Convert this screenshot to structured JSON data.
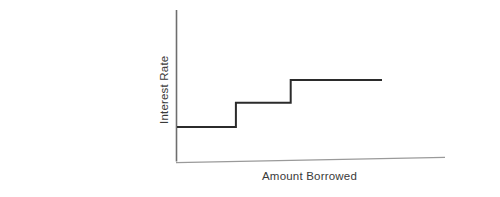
{
  "figure": {
    "background_color": "#ffffff",
    "line_color": "#2b2b2b",
    "axis_color": "#6e6e6e",
    "text_color": "#3a3a3a"
  },
  "chart_data": {
    "type": "line",
    "title": "",
    "subtitle": "",
    "xlabel": "Amount Borrowed",
    "ylabel": "Interest Rate",
    "step_style": "step-post",
    "grid": false,
    "legend": null,
    "xticks": [],
    "yticks": [],
    "xlim": [
      0,
      100
    ],
    "ylim": [
      0,
      100
    ],
    "annotations": [],
    "series": [
      {
        "name": "Interest Rate",
        "x": [
          0,
          29,
          29,
          56,
          56,
          101
        ],
        "y": [
          23,
          23,
          39,
          39,
          54,
          54
        ],
        "steps": [
          {
            "level": 1,
            "x_start": 0,
            "x_end": 29,
            "y": 23
          },
          {
            "level": 2,
            "x_start": 29,
            "x_end": 56,
            "y": 39
          },
          {
            "level": 3,
            "x_start": 56,
            "x_end": 101,
            "y": 54
          }
        ]
      }
    ]
  }
}
